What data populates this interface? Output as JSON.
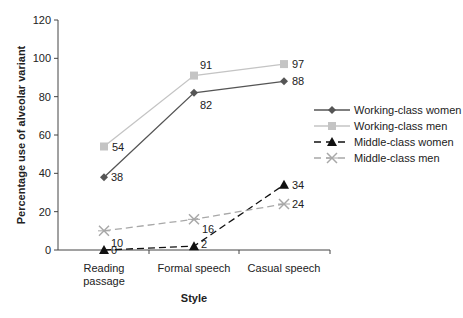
{
  "chart_data": {
    "type": "line",
    "title": "",
    "xlabel": "Style",
    "ylabel": "Percentage use of alveolar variant",
    "categories": [
      "Reading passage",
      "Formal speech",
      "Casual speech"
    ],
    "category_lines": [
      [
        "Reading",
        "passage"
      ],
      [
        "Formal speech"
      ],
      [
        "Casual speech"
      ]
    ],
    "ylim": [
      0,
      120
    ],
    "yticks": [
      0,
      20,
      40,
      60,
      80,
      100,
      120
    ],
    "grid": false,
    "legend_position": "right",
    "series": [
      {
        "name": "Working-class women",
        "values": [
          38,
          82,
          88
        ],
        "color": "#555555",
        "dash": "",
        "marker": "diamond",
        "labels": [
          "38",
          "82",
          "88"
        ]
      },
      {
        "name": "Working-class men",
        "values": [
          54,
          91,
          97
        ],
        "color": "#c4c4c4",
        "dash": "",
        "marker": "square",
        "labels": [
          "54",
          "91",
          "97"
        ]
      },
      {
        "name": "Middle-class women",
        "values": [
          0,
          2,
          34
        ],
        "color": "#111111",
        "dash": "7,4",
        "marker": "triangle",
        "labels": [
          "0",
          "2",
          "34"
        ]
      },
      {
        "name": "Middle-class men",
        "values": [
          10,
          16,
          24
        ],
        "color": "#a8a8a8",
        "dash": "7,4",
        "marker": "x",
        "labels": [
          "10",
          "16",
          "24"
        ]
      }
    ]
  }
}
